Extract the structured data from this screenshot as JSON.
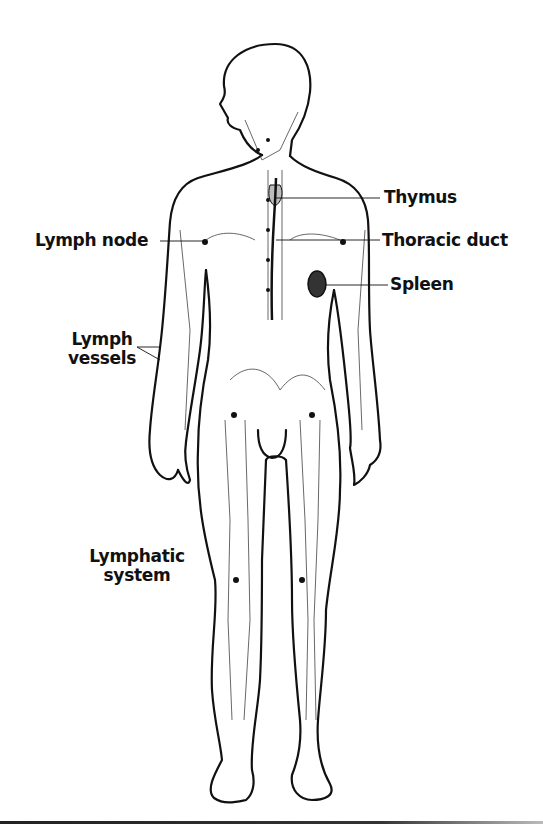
{
  "figure": {
    "subject": "Lymphatic system",
    "labels": {
      "thymus": "Thymus",
      "lymph_node": "Lymph node",
      "thoracic_duct": "Thoracic duct",
      "spleen": "Spleen",
      "lymph_vessels_line1": "Lymph",
      "lymph_vessels_line2": "vessels",
      "caption_line1": "Lymphatic",
      "caption_line2": "system"
    },
    "colors": {
      "ink": "#111111",
      "thymus_fill": "#bdbdbd",
      "spleen_fill": "#333333",
      "background": "#ffffff"
    }
  }
}
